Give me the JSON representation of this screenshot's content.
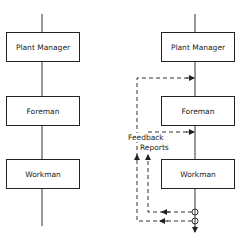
{
  "left_diagram": {
    "boxes": [
      {
        "label": "Plant Manager"
      },
      {
        "label": "Foreman"
      },
      {
        "label": "Workman"
      }
    ]
  },
  "right_diagram": {
    "boxes": [
      {
        "label": "Plant Manager"
      },
      {
        "label": "Foreman"
      },
      {
        "label": "Workman"
      }
    ],
    "feedback_labels": {
      "line1": "Feedback",
      "line2": "Reports"
    }
  },
  "colors": {
    "line": "#222222",
    "background": "#ffffff"
  }
}
